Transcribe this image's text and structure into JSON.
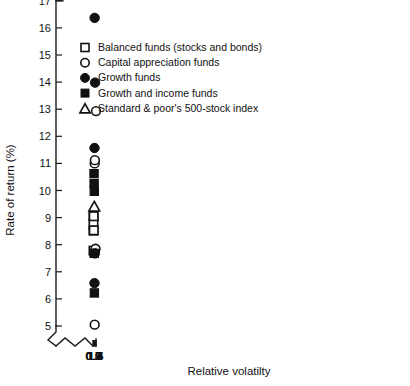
{
  "chart_data": {
    "type": "scatter",
    "title": "",
    "xlabel": "Relative volatilty",
    "ylabel": "Rate of return (%)",
    "xlim": [
      0.55,
      1.5
    ],
    "ylim": [
      4.6,
      17
    ],
    "xticks": [
      0.6,
      0.7,
      0.8,
      0.9,
      1.0,
      1.1,
      1.2,
      1.3,
      1.4,
      1.5
    ],
    "xtick_labels": [
      "0.6",
      "0.7",
      "0.8",
      "0.9",
      "1.0",
      "1.1",
      "1.2",
      "1.3",
      "1.4",
      "1.5"
    ],
    "yticks": [
      5,
      6,
      7,
      8,
      9,
      10,
      11,
      12,
      13,
      14,
      15,
      16,
      17
    ],
    "ytick_labels": [
      "5",
      "6",
      "7",
      "8",
      "9",
      "10",
      "11",
      "12",
      "13",
      "14",
      "15",
      "16",
      "17"
    ],
    "grid": false,
    "axis_break_x": true,
    "axis_break_y": true,
    "legend_position": "upper-left",
    "series": [
      {
        "name": "Balanced funds (stocks and bonds)",
        "marker": "open-square",
        "points": [
          {
            "x": 0.745,
            "y": 9.05
          },
          {
            "x": 0.745,
            "y": 8.75
          },
          {
            "x": 0.745,
            "y": 8.52
          },
          {
            "x": 0.812,
            "y": 9.05
          },
          {
            "x": 0.835,
            "y": 8.53
          },
          {
            "x": 0.745,
            "y": 7.78
          }
        ]
      },
      {
        "name": "Capital appreciation funds",
        "marker": "open-circle",
        "points": [
          {
            "x": 1.487,
            "y": 12.93
          },
          {
            "x": 1.095,
            "y": 11.0
          },
          {
            "x": 1.16,
            "y": 11.12
          },
          {
            "x": 1.355,
            "y": 7.85
          },
          {
            "x": 1.098,
            "y": 5.05
          }
        ]
      },
      {
        "name": "Growth funds",
        "marker": "filled-circle",
        "points": [
          {
            "x": 1.09,
            "y": 16.37
          },
          {
            "x": 1.22,
            "y": 13.98
          },
          {
            "x": 1.042,
            "y": 11.57
          },
          {
            "x": 1.152,
            "y": 7.68
          },
          {
            "x": 1.04,
            "y": 6.58
          }
        ]
      },
      {
        "name": "Growth and income funds",
        "marker": "filled-square",
        "points": [
          {
            "x": 0.912,
            "y": 10.62
          },
          {
            "x": 0.933,
            "y": 10.25
          },
          {
            "x": 0.985,
            "y": 9.97
          },
          {
            "x": 0.945,
            "y": 7.68
          },
          {
            "x": 1.01,
            "y": 6.22
          }
        ]
      },
      {
        "name": "Standard & poor's 500-stock index",
        "marker": "open-triangle",
        "points": [
          {
            "x": 0.983,
            "y": 9.42
          }
        ]
      }
    ]
  },
  "legend": {
    "entries": [
      {
        "label": "Balanced funds (stocks and bonds)",
        "marker": "open-square"
      },
      {
        "label": "Capital appreciation funds",
        "marker": "open-circle"
      },
      {
        "label": "Growth funds",
        "marker": "filled-circle"
      },
      {
        "label": "Growth and income funds",
        "marker": "filled-square"
      },
      {
        "label": "Standard & poor's 500-stock index",
        "marker": "open-triangle"
      }
    ]
  },
  "colors": {
    "ink": "#111111",
    "background": "#ffffff"
  }
}
